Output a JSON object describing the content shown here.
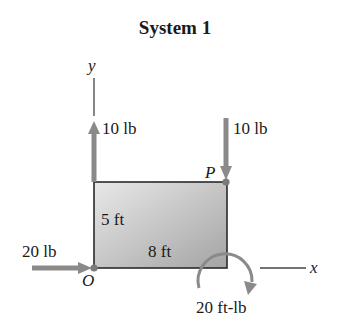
{
  "title": "System 1",
  "axes": {
    "x_label": "x",
    "y_label": "y"
  },
  "points": {
    "origin": "O",
    "p": "P"
  },
  "dimensions": {
    "height": "5 ft",
    "width": "8 ft"
  },
  "forces": [
    {
      "label": "10 lb",
      "direction": "up",
      "location": "O (top-left corner, upward at x=0)"
    },
    {
      "label": "10 lb",
      "direction": "down",
      "location": "P"
    },
    {
      "label": "20 lb",
      "direction": "right",
      "location": "O"
    }
  ],
  "moment": {
    "label": "20 ft-lb",
    "direction": "clockwise"
  },
  "colors": {
    "arrow": "#8a8a8a",
    "outline": "#2a2a2a",
    "fill_light": "#e6e6e6",
    "fill_dark": "#a6a6a6"
  }
}
